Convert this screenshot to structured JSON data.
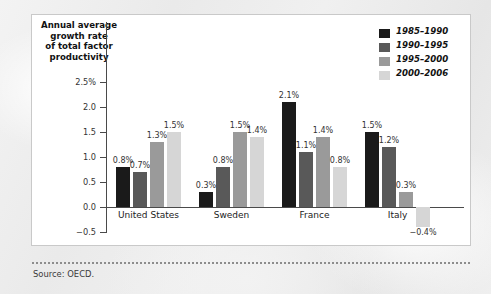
{
  "figure": {
    "panel_background": "#ffffff",
    "panel_border": "#c9c9c9",
    "page_background": "#eaeaea"
  },
  "source_note": "Source: OECD.",
  "legend": {
    "entries": [
      {
        "label": "1985–1990",
        "color": "#1a1a1a"
      },
      {
        "label": "1990–1995",
        "color": "#595959"
      },
      {
        "label": "1995–2000",
        "color": "#9a9a9a"
      },
      {
        "label": "2000–2006",
        "color": "#d6d6d6"
      }
    ]
  },
  "chart_data": {
    "type": "bar",
    "title": "",
    "ylabel": "Annual average\ngrowth rate\nof total factor\nproductivity",
    "xlabel": "",
    "categories": [
      "United States",
      "Sweden",
      "France",
      "Italy"
    ],
    "series": [
      {
        "name": "1985–1990",
        "color": "#1a1a1a",
        "values": [
          0.8,
          0.3,
          2.1,
          1.5
        ],
        "labels": [
          "0.8%",
          "0.3%",
          "2.1%",
          "1.5%"
        ]
      },
      {
        "name": "1990–1995",
        "color": "#595959",
        "values": [
          0.7,
          0.8,
          1.1,
          1.2
        ],
        "labels": [
          "0.7%",
          "0.8%",
          "1.1%",
          "1.2%"
        ]
      },
      {
        "name": "1995–2000",
        "color": "#9a9a9a",
        "values": [
          1.3,
          1.5,
          1.4,
          0.3
        ],
        "labels": [
          "1.3%",
          "1.5%",
          "1.4%",
          "0.3%"
        ]
      },
      {
        "name": "2000–2006",
        "color": "#d6d6d6",
        "values": [
          1.5,
          1.4,
          0.8,
          -0.4
        ],
        "labels": [
          "1.5%",
          "1.4%",
          "0.8%",
          "−0.4%"
        ]
      }
    ],
    "ylim": [
      -0.5,
      2.75
    ],
    "yticks": [
      -0.5,
      0.0,
      0.5,
      1.0,
      1.5,
      2.0,
      2.5
    ],
    "ytick_labels": [
      "−0.5",
      "0.0",
      "0.5",
      "1.0",
      "1.5",
      "2.0",
      "2.5%"
    ],
    "grid": false,
    "legend_position": "top-right",
    "units": "percent per year"
  }
}
